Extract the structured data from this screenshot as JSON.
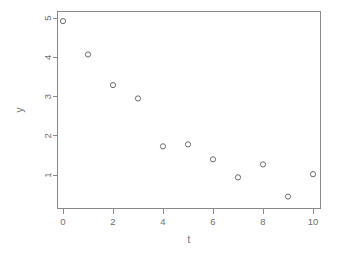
{
  "chart_data": {
    "type": "scatter",
    "title": "",
    "subtitle": "",
    "xlabel": "t",
    "ylabel": "y",
    "x": [
      0,
      1,
      2,
      3,
      4,
      5,
      6,
      7,
      8,
      9,
      10
    ],
    "values": [
      4.92,
      4.07,
      3.29,
      2.95,
      1.73,
      1.78,
      1.4,
      0.94,
      1.27,
      0.45,
      1.02
    ],
    "series": [
      {
        "name": "y",
        "points": [
          {
            "t": 0,
            "y": 4.92
          },
          {
            "t": 1,
            "y": 4.07
          },
          {
            "t": 2,
            "y": 3.29
          },
          {
            "t": 3,
            "y": 2.95
          },
          {
            "t": 4,
            "y": 1.73
          },
          {
            "t": 5,
            "y": 1.78
          },
          {
            "t": 6,
            "y": 1.4
          },
          {
            "t": 7,
            "y": 0.94
          },
          {
            "t": 8,
            "y": 1.27
          },
          {
            "t": 9,
            "y": 0.45
          },
          {
            "t": 10,
            "y": 1.02
          }
        ]
      }
    ],
    "xticks": [
      0,
      2,
      4,
      6,
      8,
      10
    ],
    "xtick_labels": [
      "0",
      "2",
      "4",
      "6",
      "8",
      "10"
    ],
    "yticks": [
      1,
      2,
      3,
      4,
      5
    ],
    "ytick_labels": [
      "1",
      "2",
      "3",
      "4",
      "5"
    ],
    "xlim": [
      -0.25,
      10.3
    ],
    "ylim": [
      0.25,
      5.08
    ],
    "grid": false,
    "legend": false,
    "legend_position": "none",
    "marker": "open-circle",
    "marker_color": "#6b6b6b",
    "axis_color": "#8a8a8a",
    "background_color": "#ffffff",
    "box_frame": true,
    "ytick_label_rotation": 90
  }
}
